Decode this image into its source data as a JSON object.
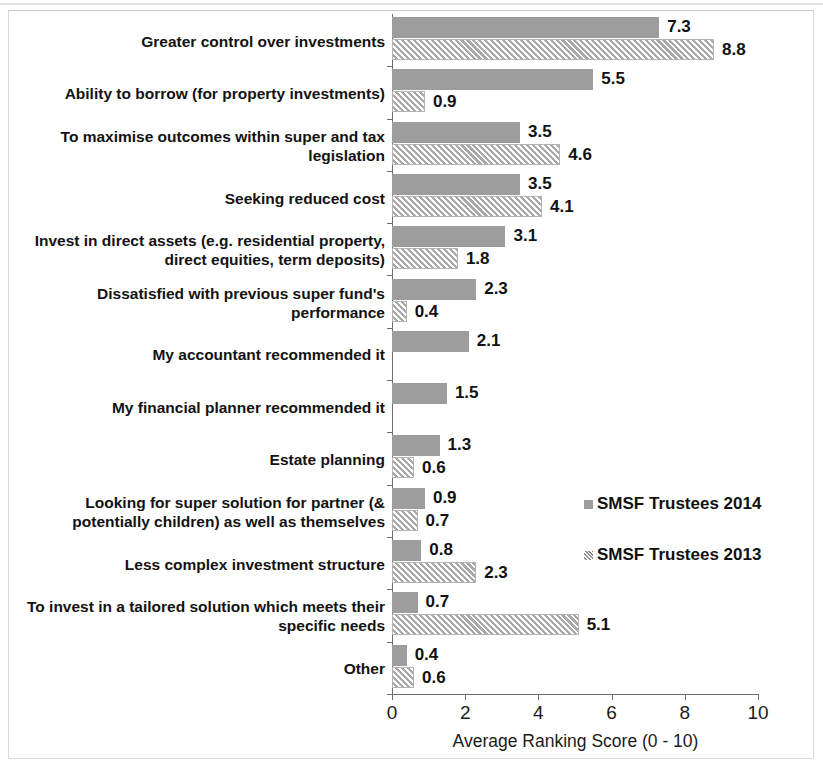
{
  "chart_data": {
    "type": "bar",
    "orientation": "horizontal",
    "title": "",
    "xlabel": "Average Ranking Score (0 - 10)",
    "ylabel": "",
    "xlim": [
      0,
      10
    ],
    "xticks": [
      "0",
      "2",
      "4",
      "6",
      "8",
      "10"
    ],
    "grid": false,
    "legend_position": "center-right",
    "categories": [
      "Greater control over investments",
      "Ability to borrow (for property investments)",
      "To maximise outcomes within super and tax legislation",
      "Seeking reduced cost",
      "Invest in direct assets (e.g. residential property, direct equities, term deposits)",
      "Dissatisfied with previous super fund's performance",
      "My accountant recommended it",
      "My financial planner recommended it",
      "Estate planning",
      "Looking for super solution for partner (& potentially children) as well as themselves",
      "Less complex investment structure",
      "To invest in a tailored solution which meets their specific needs",
      "Other"
    ],
    "series": [
      {
        "name": "SMSF Trustees 2014",
        "color": "#9d9d9d",
        "values": [
          7.3,
          5.5,
          3.5,
          3.5,
          3.1,
          2.3,
          2.1,
          1.5,
          1.3,
          0.9,
          0.8,
          0.7,
          0.4
        ],
        "labels": [
          "7.3",
          "5.5",
          "3.5",
          "3.5",
          "3.1",
          "2.3",
          "2.1",
          "1.5",
          "1.3",
          "0.9",
          "0.8",
          "0.7",
          "0.4"
        ]
      },
      {
        "name": "SMSF Trustees 2013",
        "color": "#a8a8a8",
        "pattern": "diagonal-hatch",
        "values": [
          8.8,
          0.9,
          4.6,
          4.1,
          1.8,
          0.4,
          null,
          null,
          0.6,
          0.7,
          2.3,
          5.1,
          0.6
        ],
        "labels": [
          "8.8",
          "0.9",
          "4.6",
          "4.1",
          "1.8",
          "0.4",
          "",
          "",
          "0.6",
          "0.7",
          "2.3",
          "5.1",
          "0.6"
        ]
      }
    ]
  },
  "legend": {
    "items": [
      {
        "label": "SMSF Trustees 2014"
      },
      {
        "label": "SMSF Trustees 2013"
      }
    ]
  },
  "axis": {
    "x_title": "Average Ranking Score (0 - 10)"
  }
}
